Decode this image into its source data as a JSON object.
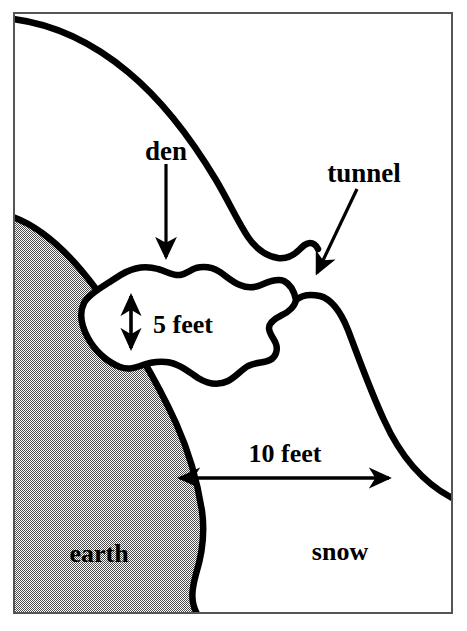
{
  "diagram": {
    "frame": {
      "border_color": "#555555",
      "background_color": "#ffffff"
    },
    "regions": [
      {
        "name": "earth",
        "label": "earth",
        "fill_style": "gray-stipple",
        "fill_color": "#a8a8a8"
      },
      {
        "name": "snow",
        "label": "snow",
        "fill_style": "solid",
        "fill_color": "#ffffff"
      }
    ],
    "labels": {
      "den": "den",
      "tunnel": "tunnel",
      "earth": "earth",
      "snow": "snow"
    },
    "measurements": [
      {
        "name": "den-height",
        "text": "5 feet",
        "value": 5,
        "unit": "feet",
        "orientation": "vertical",
        "arrow_style": "double-headed"
      },
      {
        "name": "tunnel-length",
        "text": "10 feet",
        "value": 10,
        "unit": "feet",
        "orientation": "horizontal",
        "arrow_style": "double-headed"
      }
    ],
    "pointers": [
      {
        "name": "den-pointer",
        "label": "den",
        "direction": "down",
        "arrow_style": "single-headed"
      },
      {
        "name": "tunnel-pointer",
        "label": "tunnel",
        "direction": "down-left",
        "arrow_style": "single-headed"
      }
    ],
    "stroke_color": "#000000",
    "text_color": "#000000"
  }
}
